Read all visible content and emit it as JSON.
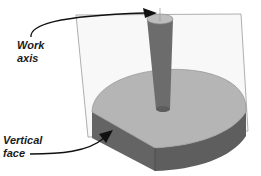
{
  "figure": {
    "labels": {
      "work_axis": {
        "line1": "Work",
        "line2": "axis"
      },
      "vertical_face": {
        "line1": "Vertical",
        "line2": "face"
      }
    },
    "colors": {
      "background": "#ffffff",
      "work_plane_fill": "#f7f7f7",
      "work_plane_edge": "#9a9a9a",
      "base_top": "#b3b3b3",
      "base_side": "#686868",
      "base_side_dark": "#5a5a5a",
      "cylinder_body": "#6e6e6e",
      "cylinder_top": "#bdbdbd",
      "arrow": "#111111",
      "text": "#1a1a1a"
    }
  }
}
